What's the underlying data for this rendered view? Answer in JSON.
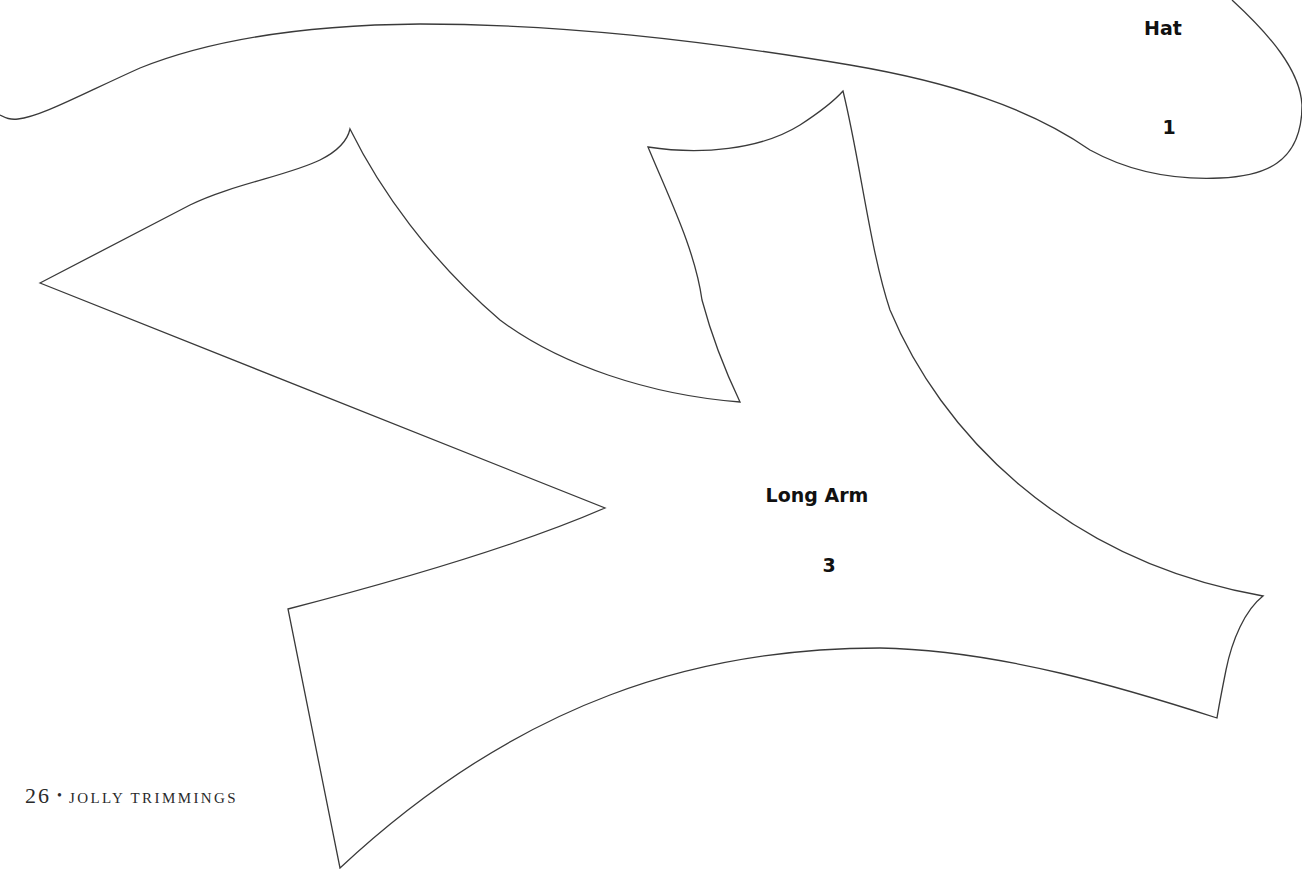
{
  "page": {
    "type": "craft pattern template page",
    "background": "#ffffff",
    "outline_color": "#3a3a3a"
  },
  "pieces": [
    {
      "name": "Hat",
      "number": "1",
      "label_position": {
        "x": 1163,
        "y": 53
      },
      "number_position": {
        "x": 1169,
        "y": 127
      }
    },
    {
      "name": "Long Arm",
      "number": "3",
      "label_position": {
        "x": 817,
        "y": 495
      },
      "number_position": {
        "x": 829,
        "y": 565
      }
    }
  ],
  "footer": {
    "page_number": "26",
    "separator": "•",
    "book_title": "Jolly Trimmings"
  }
}
